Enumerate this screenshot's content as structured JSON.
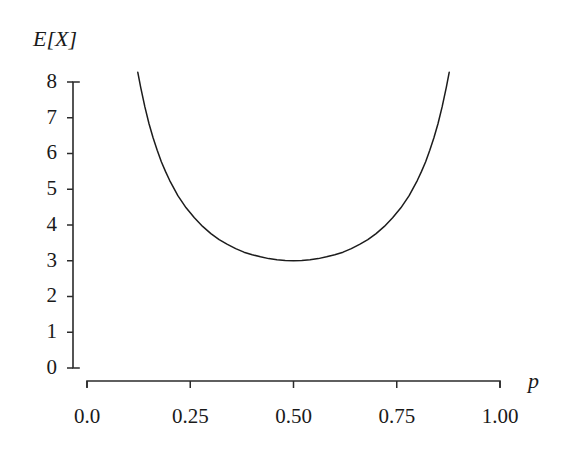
{
  "chart_data": {
    "type": "line",
    "title": "",
    "subtitle": "",
    "xlabel": "p",
    "ylabel": "E[X]",
    "xlim": [
      0.0,
      1.0
    ],
    "ylim": [
      0,
      8
    ],
    "grid": false,
    "legend": null,
    "legend_position": "none",
    "annotations": [],
    "x_ticks": [
      {
        "value": 0.0,
        "label": "0.0"
      },
      {
        "value": 0.25,
        "label": "0.25"
      },
      {
        "value": 0.5,
        "label": "0.50"
      },
      {
        "value": 0.75,
        "label": "0.75"
      },
      {
        "value": 1.0,
        "label": "1.00"
      }
    ],
    "y_ticks": [
      {
        "value": 0,
        "label": "0"
      },
      {
        "value": 1,
        "label": "1"
      },
      {
        "value": 2,
        "label": "2"
      },
      {
        "value": 3,
        "label": "3"
      },
      {
        "value": 4,
        "label": "4"
      },
      {
        "value": 5,
        "label": "5"
      },
      {
        "value": 6,
        "label": "6"
      },
      {
        "value": 7,
        "label": "7"
      },
      {
        "value": 8,
        "label": "8"
      }
    ],
    "curve_color": "#1c1c1c",
    "axis_color": "#2b2b2b",
    "background_color": "#ffffff",
    "series": [
      {
        "name": "E[X]",
        "formula": "1/(p*(1-p)) - 1",
        "x": [
          0.123,
          0.13,
          0.14,
          0.15,
          0.16,
          0.17,
          0.18,
          0.19,
          0.2,
          0.22,
          0.24,
          0.26,
          0.28,
          0.3,
          0.32,
          0.34,
          0.36,
          0.38,
          0.4,
          0.42,
          0.44,
          0.46,
          0.48,
          0.5,
          0.52,
          0.54,
          0.56,
          0.58,
          0.6,
          0.62,
          0.64,
          0.66,
          0.68,
          0.7,
          0.72,
          0.74,
          0.76,
          0.78,
          0.8,
          0.81,
          0.82,
          0.83,
          0.84,
          0.85,
          0.86,
          0.87,
          0.877
        ],
        "y": [
          8.27,
          7.85,
          7.31,
          6.84,
          6.44,
          6.09,
          5.77,
          5.5,
          5.25,
          4.82,
          4.48,
          4.2,
          3.96,
          3.76,
          3.59,
          3.46,
          3.34,
          3.24,
          3.17,
          3.11,
          3.06,
          3.03,
          3.01,
          3.0,
          3.01,
          3.03,
          3.06,
          3.11,
          3.17,
          3.24,
          3.34,
          3.46,
          3.59,
          3.76,
          3.96,
          4.2,
          4.48,
          4.82,
          5.25,
          5.5,
          5.77,
          6.09,
          6.44,
          6.84,
          7.31,
          7.85,
          8.27
        ],
        "min_point": {
          "x": 0.5,
          "y": 3.0
        }
      }
    ]
  }
}
